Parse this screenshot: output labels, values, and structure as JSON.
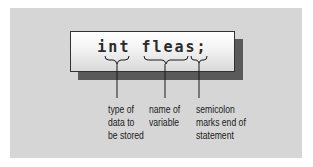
{
  "diagram": {
    "statement": "int fleas;",
    "parts": [
      {
        "token": "int",
        "label_lines": [
          "type of",
          "data to",
          "be stored"
        ]
      },
      {
        "token": "fleas",
        "label_lines": [
          "name of",
          "variable"
        ]
      },
      {
        "token": ";",
        "label_lines": [
          "semicolon",
          "marks end of",
          "statement"
        ]
      }
    ]
  },
  "colors": {
    "panel_background": "#d6d6d6",
    "box_shadow": "#5a5a5a",
    "text": "#1a1a1a"
  }
}
